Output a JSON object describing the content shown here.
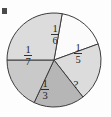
{
  "figure": {
    "corner_mark": "tick-mark"
  },
  "chart_data": {
    "type": "pie",
    "title": "",
    "xlabel": "",
    "ylabel": "",
    "legend": "none",
    "grid": false,
    "total": 1,
    "unknown_label": "?",
    "categories": [
      "1/6",
      "1/5",
      "?",
      "1/3",
      "1/7"
    ],
    "values": [
      0.1667,
      0.2,
      0.1762,
      0.3333,
      0.1429
    ],
    "labels": [
      "1/6",
      "1/5",
      "?",
      "1/3",
      "1/7"
    ],
    "slices": [
      {
        "id": "slice-one-sixth",
        "label": "1/6",
        "numerator": "1",
        "denominator": "6",
        "value": 0.1667,
        "color": "#fbfbfb",
        "start_angle_deg": -80,
        "end_angle_deg": -20,
        "label_x": 55,
        "label_y": 33
      },
      {
        "id": "slice-one-fifth",
        "label": "1/5",
        "numerator": "1",
        "denominator": "5",
        "value": 0.2,
        "color": "#dcdcdc",
        "start_angle_deg": -20,
        "end_angle_deg": 52,
        "label_x": 78,
        "label_y": 52
      },
      {
        "id": "slice-unknown",
        "label": "?",
        "numerator": "",
        "denominator": "",
        "value": 0.1762,
        "color": "#b6b6b6",
        "start_angle_deg": 52,
        "end_angle_deg": 115,
        "label_x": 76,
        "label_y": 84
      },
      {
        "id": "slice-one-third",
        "label": "1/3",
        "numerator": "1",
        "denominator": "3",
        "value": 0.3333,
        "color": "#c9c9c9",
        "start_angle_deg": 115,
        "end_angle_deg": 180,
        "label_x": 45,
        "label_y": 88
      },
      {
        "id": "slice-one-seventh",
        "label": "1/7",
        "numerator": "1",
        "denominator": "7",
        "value": 0.1429,
        "color": "#dcdcdc",
        "start_angle_deg": 180,
        "end_angle_deg": 280,
        "label_x": 28,
        "label_y": 54
      }
    ],
    "geometry": {
      "center_x": 54,
      "center_y": 60,
      "radius": 47
    }
  }
}
